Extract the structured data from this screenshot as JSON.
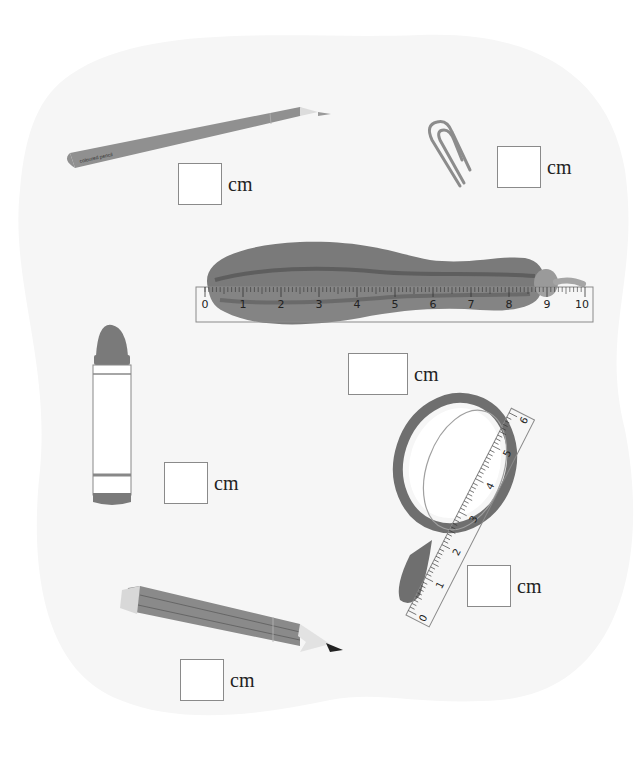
{
  "worksheet": {
    "header_fragment": "",
    "unit_label": "cm",
    "items": [
      {
        "name": "colored-pencil",
        "label": "coloured pencil",
        "answer": ""
      },
      {
        "name": "paper-clip",
        "answer": ""
      },
      {
        "name": "zucchini",
        "answer": ""
      },
      {
        "name": "crayon",
        "answer": ""
      },
      {
        "name": "magnifying-glass",
        "answer": ""
      },
      {
        "name": "pencil",
        "answer": ""
      }
    ],
    "ruler_horizontal": {
      "ticks": [
        "0",
        "1",
        "2",
        "3",
        "4",
        "5",
        "6",
        "7",
        "8",
        "9",
        "10"
      ]
    },
    "ruler_diagonal": {
      "ticks": [
        "0",
        "1",
        "2",
        "3",
        "4",
        "5",
        "6"
      ]
    },
    "colors": {
      "background_blob": "#f6f6f6",
      "object_gray": "#8c8c8c",
      "object_dark": "#6f6f6f",
      "box_border": "#8a8a8a"
    }
  }
}
